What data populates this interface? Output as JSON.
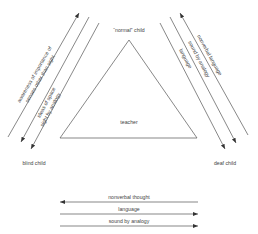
{
  "diagram": {
    "nodes": {
      "top": "“normal” child",
      "center": "teacher",
      "left": "blind child",
      "right": "deaf child"
    },
    "left_arrows": [
      {
        "label": "awareness of importance of",
        "label2": "senses other than sight",
        "direction": "toward normal child"
      },
      {
        "label": "ideas of space",
        "direction": "toward blind child"
      },
      {
        "label": "sight by analogy",
        "direction": "toward blind child"
      }
    ],
    "right_arrows": [
      {
        "label": "nonverbal language",
        "direction": "toward normal child"
      },
      {
        "label": "sound by analogy",
        "direction": "toward deaf child"
      },
      {
        "label": "language",
        "direction": "toward deaf child"
      }
    ],
    "bottom_arrows": [
      {
        "label": "nonverbal thought",
        "direction": "toward blind child"
      },
      {
        "label": "language",
        "direction": "toward deaf child"
      },
      {
        "label": "sound by analogy",
        "direction": "toward deaf child"
      }
    ],
    "colors": {
      "line": "#555555",
      "text": "#444444",
      "background": "#ffffff"
    }
  }
}
